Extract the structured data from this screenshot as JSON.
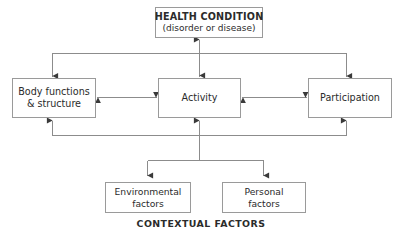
{
  "diagram": {
    "title_caption": "CONTEXTUAL FACTORS",
    "nodes": {
      "health_condition": {
        "line1": "HEALTH CONDITION",
        "line2": "(disorder or disease)"
      },
      "body_functions": {
        "line1": "Body functions",
        "line2": "& structure"
      },
      "activity": {
        "line1": "Activity"
      },
      "participation": {
        "line1": "Participation"
      },
      "environmental_factors": {
        "line1": "Environmental",
        "line2": "factors"
      },
      "personal_factors": {
        "line1": "Personal",
        "line2": "factors"
      }
    },
    "colors": {
      "box_border": "#9a9a9a",
      "connector": "#8c8c8c",
      "text": "#2b2b2b",
      "arrowhead": "#3a3a3a",
      "background": "#ffffff"
    },
    "connectors": [
      {
        "name": "health-to-activity",
        "from": "health_condition",
        "to": "activity",
        "heads": "both"
      },
      {
        "name": "health-bus-to-body",
        "from": "health_condition",
        "to": "body_functions",
        "heads": "end"
      },
      {
        "name": "health-bus-to-participation",
        "from": "health_condition",
        "to": "participation",
        "heads": "end"
      },
      {
        "name": "body-to-activity",
        "from": "body_functions",
        "to": "activity",
        "heads": "both"
      },
      {
        "name": "activity-to-participation",
        "from": "activity",
        "to": "participation",
        "heads": "both"
      },
      {
        "name": "contextual-bus-to-body",
        "from": "contextual_factors",
        "to": "body_functions",
        "heads": "end"
      },
      {
        "name": "contextual-bus-to-activity",
        "from": "contextual_factors",
        "to": "activity",
        "heads": "end"
      },
      {
        "name": "contextual-bus-to-participation",
        "from": "contextual_factors",
        "to": "participation",
        "heads": "end"
      },
      {
        "name": "contextual-bus-to-environmental",
        "from": "contextual_factors",
        "to": "environmental_factors",
        "heads": "end"
      },
      {
        "name": "contextual-bus-to-personal",
        "from": "contextual_factors",
        "to": "personal_factors",
        "heads": "end"
      }
    ]
  }
}
